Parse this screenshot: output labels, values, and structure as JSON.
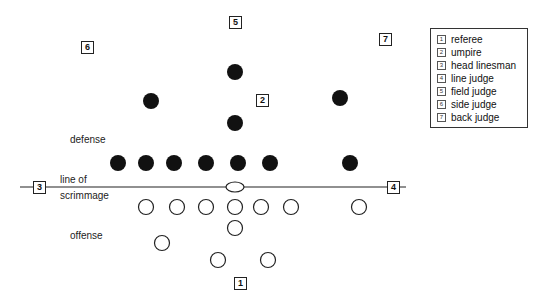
{
  "labels": {
    "defense": "defense",
    "line_of_scrimmage_1": "line of",
    "line_of_scrimmage_2": "scrimmage",
    "offense": "offense"
  },
  "officials_on_field": [
    {
      "num": "1",
      "x": 240,
      "y": 283
    },
    {
      "num": "2",
      "x": 262,
      "y": 100
    },
    {
      "num": "3",
      "x": 39,
      "y": 187
    },
    {
      "num": "4",
      "x": 393,
      "y": 187
    },
    {
      "num": "5",
      "x": 235,
      "y": 22
    },
    {
      "num": "6",
      "x": 87,
      "y": 47
    },
    {
      "num": "7",
      "x": 385,
      "y": 39
    }
  ],
  "legend": [
    {
      "num": "1",
      "label": "referee"
    },
    {
      "num": "2",
      "label": "umpire"
    },
    {
      "num": "3",
      "label": "head linesman"
    },
    {
      "num": "4",
      "label": "line judge"
    },
    {
      "num": "5",
      "label": "field judge"
    },
    {
      "num": "6",
      "label": "side judge"
    },
    {
      "num": "7",
      "label": "back judge"
    }
  ]
}
